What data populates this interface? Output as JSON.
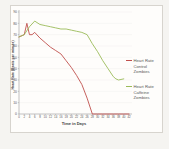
{
  "chart_data": {
    "type": "line",
    "title": "",
    "xlabel": "Time in Days",
    "ylabel": "Heart Rate (Beats per minute)",
    "xlim": [
      0,
      42
    ],
    "ylim": [
      0,
      90
    ],
    "x_ticks": [
      0,
      2,
      4,
      6,
      8,
      10,
      12,
      14,
      16,
      18,
      20,
      22,
      24,
      26,
      28,
      30,
      32,
      34,
      36,
      38,
      40,
      42
    ],
    "y_ticks": [
      0,
      10,
      20,
      30,
      40,
      50,
      60,
      70,
      80,
      90
    ],
    "grid": "horizontal-faint",
    "legend_position": "right",
    "series": [
      {
        "name": "Heart Rate Control Zombies",
        "color": "#c0504d",
        "x": [
          0,
          2,
          3,
          4,
          5,
          6,
          8,
          10,
          12,
          14,
          16,
          18,
          20,
          22,
          24,
          26,
          28,
          30,
          32,
          34,
          36,
          38,
          40,
          42
        ],
        "y": [
          68,
          70,
          80,
          70,
          70,
          72,
          67,
          63,
          59,
          56,
          53,
          47,
          41,
          34,
          26,
          14,
          0,
          0,
          0,
          0,
          0,
          0,
          0,
          0
        ]
      },
      {
        "name": "Heart Rate Caffeine Zombies",
        "color": "#9bbb59",
        "x": [
          0,
          2,
          4,
          6,
          8,
          10,
          12,
          14,
          16,
          18,
          20,
          22,
          24,
          26,
          28,
          30,
          32,
          34,
          36,
          37,
          38,
          40
        ],
        "y": [
          68,
          70,
          77,
          82,
          79,
          78,
          77,
          76,
          75,
          75,
          74,
          73,
          72,
          70,
          62,
          55,
          47,
          40,
          33,
          31,
          30,
          31
        ]
      }
    ]
  },
  "colors": {
    "page_background": "#f5f4f1",
    "chart_background": "#fefdfb",
    "chart_border": "#d7d4ce",
    "axis": "#9a9a9a",
    "tick_text": "#595959",
    "series_control": "#c0504d",
    "series_caffeine": "#9bbb59"
  }
}
